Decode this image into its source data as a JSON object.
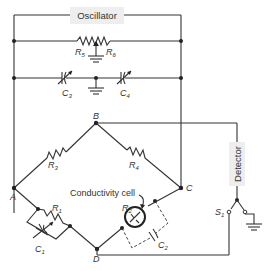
{
  "diagram": {
    "oscillator_label": "Oscillator",
    "detector_label": "Detector",
    "conductivity_cell_label": "Conductivity cell",
    "nodes": {
      "A": "A",
      "B": "B",
      "C": "C",
      "D": "D"
    },
    "components": {
      "R1": "R",
      "R1_sub": "1",
      "R2": "R",
      "R2_sub": "2",
      "R3": "R",
      "R3_sub": "3",
      "R4": "R",
      "R4_sub": "4",
      "R5": "R",
      "R5_sub": "5",
      "R6": "R",
      "R6_sub": "6",
      "C1": "C",
      "C1_sub": "1",
      "C2": "C",
      "C2_sub": "2",
      "C3": "C",
      "C3_sub": "3",
      "C4": "C",
      "C4_sub": "4",
      "S1": "S",
      "S1_sub": "1"
    },
    "colors": {
      "wire": "#333333",
      "box_fill": "#eeeeee",
      "background": "#ffffff"
    }
  }
}
